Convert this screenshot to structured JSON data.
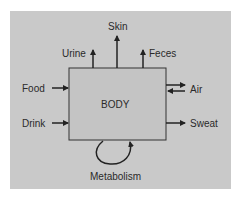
{
  "diagram": {
    "center_label": "BODY",
    "colors": {
      "panel": "#c9c9c9",
      "body_box": "#c4c4c4",
      "stroke": "#222222",
      "text": "#2a2a2a",
      "background": "#ffffff"
    },
    "inputs": [
      {
        "label": "Food",
        "direction": "in",
        "side": "left"
      },
      {
        "label": "Drink",
        "direction": "in",
        "side": "left"
      },
      {
        "label": "Air",
        "direction": "in-out",
        "side": "right"
      }
    ],
    "outputs": [
      {
        "label": "Urine",
        "direction": "out",
        "side": "top"
      },
      {
        "label": "Skin",
        "direction": "out",
        "side": "top"
      },
      {
        "label": "Feces",
        "direction": "out",
        "side": "top"
      },
      {
        "label": "Sweat",
        "direction": "out",
        "side": "right"
      },
      {
        "label": "Air",
        "direction": "out",
        "side": "right"
      }
    ],
    "internal": [
      {
        "label": "Metabolism",
        "direction": "loop",
        "side": "bottom"
      }
    ]
  }
}
